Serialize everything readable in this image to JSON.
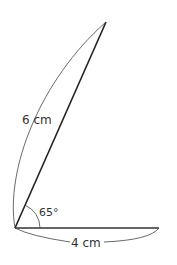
{
  "diagram": {
    "type": "angle-construction",
    "vertex": "bottom-left",
    "angle_label": "65°",
    "side_long": {
      "label": "6 cm",
      "length_cm": 6
    },
    "side_short": {
      "label": "4 cm",
      "length_cm": 4
    },
    "colors": {
      "stroke": "#222222",
      "text": "#333333",
      "background": "#ffffff"
    }
  }
}
